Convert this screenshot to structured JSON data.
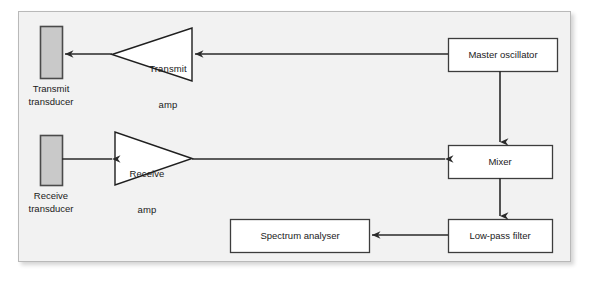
{
  "diagram": {
    "background_color": "#f2f2f2",
    "frame_border_color": "#b9b9b9",
    "line_color": "#2a2a2a",
    "box_fill": "#ffffff",
    "box_border": "#3d3d3d",
    "transducer_fill": "#c9c9c9",
    "transducer_border": "#4a4a4a",
    "nodes": [
      {
        "id": "transmit-transducer",
        "shape": "rectangle-vertical",
        "caption": "Transmit\ntransducer",
        "caption_line1": "Transmit",
        "caption_line2": "transducer",
        "x": 40,
        "y": 26,
        "w": 22,
        "h": 52
      },
      {
        "id": "transmit-amp",
        "shape": "triangle-left",
        "label": "Transmit\namp",
        "label_line1": "Transmit",
        "label_line2": "amp",
        "x": 112,
        "y": 28,
        "w": 80,
        "h": 53
      },
      {
        "id": "master-oscillator",
        "shape": "rectangle",
        "label": "Master oscillator",
        "x": 448,
        "y": 38,
        "w": 109,
        "h": 33
      },
      {
        "id": "receive-transducer",
        "shape": "rectangle-vertical",
        "caption": "Receive\ntransducer",
        "caption_line1": "Receive",
        "caption_line2": "transducer",
        "x": 40,
        "y": 135,
        "w": 22,
        "h": 50
      },
      {
        "id": "receive-amp",
        "shape": "triangle-right",
        "label": "Receive\namp",
        "label_line1": "Receive",
        "label_line2": "amp",
        "x": 115,
        "y": 132,
        "w": 77,
        "h": 53
      },
      {
        "id": "mixer",
        "shape": "rectangle",
        "label": "Mixer",
        "x": 448,
        "y": 145,
        "w": 104,
        "h": 33
      },
      {
        "id": "low-pass-filter",
        "shape": "rectangle",
        "label": "Low-pass filter",
        "x": 448,
        "y": 219,
        "w": 104,
        "h": 33
      },
      {
        "id": "spectrum-analyser",
        "shape": "rectangle",
        "label": "Spectrum analyser",
        "x": 230,
        "y": 219,
        "w": 139,
        "h": 33
      }
    ],
    "edges": [
      {
        "id": "osc-to-transmit-amp",
        "from": "master-oscillator",
        "to": "transmit-amp",
        "direction": "left",
        "y": 54
      },
      {
        "id": "transmit-amp-to-transducer",
        "from": "transmit-amp",
        "to": "transmit-transducer",
        "direction": "left",
        "y": 54
      },
      {
        "id": "osc-to-mixer",
        "from": "master-oscillator",
        "to": "mixer",
        "direction": "down",
        "x": 500
      },
      {
        "id": "receive-transducer-to-amp",
        "from": "receive-transducer",
        "to": "receive-amp",
        "direction": "right",
        "y": 159
      },
      {
        "id": "receive-amp-to-mixer",
        "from": "receive-amp",
        "to": "mixer",
        "direction": "right",
        "y": 159
      },
      {
        "id": "mixer-to-lpf",
        "from": "mixer",
        "to": "low-pass-filter",
        "direction": "down",
        "x": 500
      },
      {
        "id": "lpf-to-spectrum-analyser",
        "from": "low-pass-filter",
        "to": "spectrum-analyser",
        "direction": "left",
        "y": 235
      }
    ]
  }
}
